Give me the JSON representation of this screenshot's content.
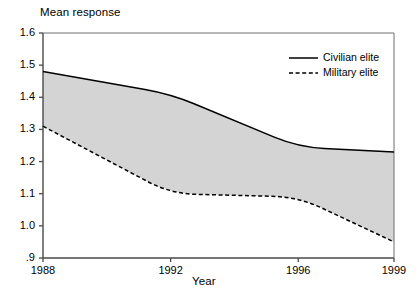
{
  "chart_data": {
    "type": "line",
    "title": "",
    "ylabel": "Mean response",
    "xlabel": "Year",
    "x": [
      1988,
      1992,
      1996,
      1999
    ],
    "xticklabels": [
      "1988",
      "1992",
      "1996",
      "1999"
    ],
    "yticklabels": [
      ".9",
      "1.0",
      "1.1",
      "1.2",
      "1.3",
      "1.4",
      "1.5",
      "1.6"
    ],
    "ytickvalues": [
      0.9,
      1.0,
      1.1,
      1.2,
      1.3,
      1.4,
      1.5,
      1.6
    ],
    "ylim": [
      0.9,
      1.6
    ],
    "xlim": [
      1988,
      1999
    ],
    "grid": false,
    "legend_position": "top-right",
    "fill_between": true,
    "fill_color": "#d4d4d4",
    "series": [
      {
        "name": "Civilian elite",
        "style": "solid",
        "color": "#000000",
        "values": [
          1.48,
          1.41,
          1.245,
          1.23
        ]
      },
      {
        "name": "Military elite",
        "style": "dashed",
        "color": "#000000",
        "values": [
          1.31,
          1.1,
          1.09,
          0.95
        ]
      }
    ]
  },
  "axes": {
    "ylabel": "Mean response",
    "xlabel": "Year",
    "yticks": [
      {
        "label": "1.6"
      },
      {
        "label": "1.5"
      },
      {
        "label": "1.4"
      },
      {
        "label": "1.3"
      },
      {
        "label": "1.2"
      },
      {
        "label": "1.1"
      },
      {
        "label": "1.0"
      },
      {
        "label": ".9"
      }
    ],
    "xticks": [
      {
        "label": "1988"
      },
      {
        "label": "1992"
      },
      {
        "label": "1996"
      },
      {
        "label": "1999"
      }
    ]
  },
  "legend": {
    "entries": [
      {
        "label": "Civilian elite",
        "style": "solid"
      },
      {
        "label": "Military elite",
        "style": "dashed"
      }
    ]
  },
  "colors": {
    "band_fill": "#d4d4d4",
    "line": "#000000",
    "axis": "#000000",
    "background": "#ffffff"
  }
}
